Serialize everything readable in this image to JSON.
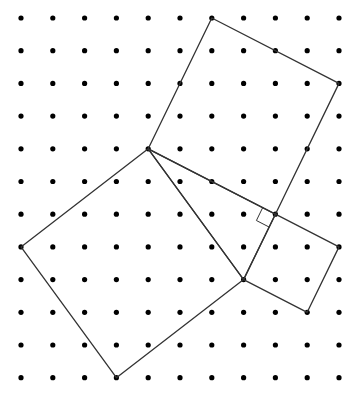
{
  "diagram": {
    "type": "geoboard-pythagorean",
    "grid": {
      "columns": 11,
      "rows": 12,
      "origin_x": 21,
      "origin_y": 18,
      "step_x": 31.8,
      "step_y": 32.7,
      "dot_radius": 2.6,
      "dot_color": "#000000"
    },
    "line_color": "#333333",
    "line_width": 1.3,
    "triangle": {
      "vertices": [
        [
          4,
          4
        ],
        [
          7,
          8
        ],
        [
          8,
          6
        ]
      ],
      "right_angle_at": [
        8,
        6
      ]
    },
    "squares": [
      {
        "name": "hypotenuse-square",
        "vertices": [
          [
            4,
            4
          ],
          [
            7,
            8
          ],
          [
            3,
            11
          ],
          [
            0,
            7
          ]
        ]
      },
      {
        "name": "leg-long-square",
        "vertices": [
          [
            4,
            4
          ],
          [
            8,
            6
          ],
          [
            10,
            2
          ],
          [
            6,
            0
          ]
        ]
      },
      {
        "name": "leg-short-square",
        "vertices": [
          [
            8,
            6
          ],
          [
            7,
            8
          ],
          [
            9,
            9
          ],
          [
            10,
            7
          ]
        ]
      }
    ],
    "right_angle_marker_size": 0.45
  }
}
